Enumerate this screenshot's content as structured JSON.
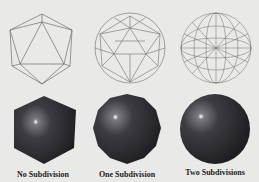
{
  "figure": {
    "background": "#e9e9e7",
    "wire_color": "#6e6e6e",
    "solid_color": "#3a3a3e",
    "columns": [
      {
        "label": "No Subdivision",
        "level": 0
      },
      {
        "label": "One Subdivision",
        "level": 1
      },
      {
        "label": "Two Subdivisions",
        "level": 2
      }
    ]
  }
}
